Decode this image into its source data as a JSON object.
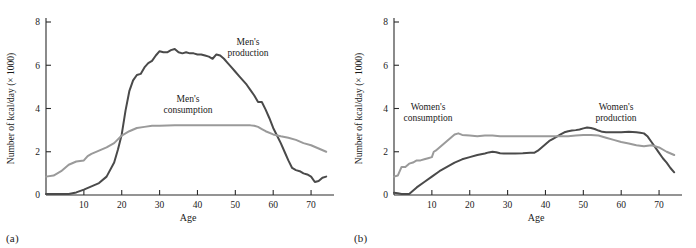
{
  "figure": {
    "panels": [
      {
        "caption": "(a)",
        "id": "panel-a",
        "annotations": [
          {
            "name": "mens-production-label",
            "lines": [
              "Men's",
              "production"
            ],
            "x": 248,
            "y": 45
          },
          {
            "name": "mens-consumption-label",
            "lines": [
              "Men's",
              "consumption"
            ],
            "x": 188,
            "y": 102
          }
        ]
      },
      {
        "caption": "(b)",
        "id": "panel-b",
        "annotations": [
          {
            "name": "womens-consumption-label",
            "lines": [
              "Women's",
              "consumption"
            ],
            "x": 80,
            "y": 110
          },
          {
            "name": "womens-production-label",
            "lines": [
              "Women's",
              "production"
            ],
            "x": 268,
            "y": 110
          }
        ]
      }
    ]
  },
  "chart_data": [
    {
      "type": "line",
      "panel": "(a)",
      "title": "",
      "xlabel": "Age",
      "ylabel": "Number of kcal/day (× 1000)",
      "xlim": [
        0,
        75
      ],
      "ylim": [
        0,
        8
      ],
      "xticks": [
        10,
        20,
        30,
        40,
        50,
        60,
        70
      ],
      "yticks": [
        0,
        2,
        4,
        6,
        8
      ],
      "grid": false,
      "legend": "annotations",
      "series": [
        {
          "name": "Men's production",
          "color": "#4a4a4a",
          "x": [
            0,
            2,
            4,
            6,
            8,
            10,
            12,
            14,
            16,
            18,
            19,
            20,
            21,
            22,
            23,
            24,
            25,
            26,
            27,
            28,
            29,
            30,
            31,
            32,
            33,
            34,
            35,
            36,
            37,
            38,
            39,
            40,
            41,
            42,
            43,
            44,
            45,
            46,
            47,
            48,
            49,
            50,
            51,
            52,
            53,
            54,
            55,
            56,
            57,
            58,
            59,
            60,
            61,
            62,
            63,
            64,
            65,
            66,
            67,
            68,
            69,
            70,
            71,
            72,
            73,
            74
          ],
          "y": [
            0.05,
            0.05,
            0.05,
            0.05,
            0.12,
            0.25,
            0.4,
            0.55,
            0.85,
            1.5,
            2.1,
            2.8,
            3.9,
            4.8,
            5.3,
            5.55,
            5.6,
            5.9,
            6.1,
            6.2,
            6.45,
            6.65,
            6.6,
            6.6,
            6.7,
            6.75,
            6.6,
            6.55,
            6.6,
            6.55,
            6.55,
            6.5,
            6.5,
            6.45,
            6.4,
            6.3,
            6.5,
            6.45,
            6.3,
            6.1,
            5.9,
            5.7,
            5.5,
            5.3,
            5.1,
            4.85,
            4.6,
            4.3,
            4.3,
            3.95,
            3.55,
            3.1,
            2.75,
            2.4,
            2.0,
            1.6,
            1.25,
            1.15,
            1.1,
            1.0,
            0.95,
            0.85,
            0.6,
            0.65,
            0.8,
            0.85
          ]
        },
        {
          "name": "Men's consumption",
          "color": "#9a9a9a",
          "x": [
            0,
            2,
            4,
            6,
            8,
            10,
            11,
            12,
            14,
            16,
            18,
            20,
            22,
            24,
            26,
            28,
            30,
            34,
            38,
            42,
            46,
            50,
            52,
            54,
            55,
            56,
            57,
            58,
            60,
            62,
            64,
            66,
            68,
            70,
            72,
            74
          ],
          "y": [
            0.85,
            0.9,
            1.1,
            1.4,
            1.55,
            1.6,
            1.8,
            1.9,
            2.05,
            2.2,
            2.4,
            2.75,
            2.95,
            3.1,
            3.15,
            3.2,
            3.2,
            3.22,
            3.22,
            3.22,
            3.22,
            3.22,
            3.22,
            3.22,
            3.2,
            3.15,
            3.05,
            2.95,
            2.8,
            2.72,
            2.65,
            2.55,
            2.4,
            2.3,
            2.15,
            2.0
          ]
        }
      ]
    },
    {
      "type": "line",
      "panel": "(b)",
      "title": "",
      "xlabel": "Age",
      "ylabel": "Number of kcal/day (× 1000)",
      "xlim": [
        0,
        75
      ],
      "ylim": [
        0,
        8
      ],
      "xticks": [
        10,
        20,
        30,
        40,
        50,
        60,
        70
      ],
      "yticks": [
        0,
        2,
        4,
        6,
        8
      ],
      "grid": false,
      "legend": "annotations",
      "series": [
        {
          "name": "Women's production",
          "color": "#4a4a4a",
          "x": [
            0,
            1,
            2,
            3,
            4,
            5,
            6,
            8,
            10,
            12,
            14,
            16,
            18,
            20,
            22,
            24,
            25,
            26,
            27,
            28,
            29,
            30,
            32,
            34,
            36,
            37,
            38,
            39,
            40,
            41,
            42,
            43,
            44,
            45,
            46,
            47,
            48,
            49,
            50,
            51,
            52,
            53,
            54,
            55,
            56,
            58,
            60,
            62,
            64,
            65,
            66,
            67,
            68,
            69,
            70,
            71,
            72,
            73,
            74
          ],
          "y": [
            0.1,
            0.08,
            0.05,
            0.05,
            0.05,
            0.2,
            0.35,
            0.6,
            0.85,
            1.1,
            1.3,
            1.5,
            1.65,
            1.75,
            1.85,
            1.92,
            1.97,
            2.0,
            1.98,
            1.93,
            1.92,
            1.92,
            1.92,
            1.93,
            1.95,
            1.95,
            2.05,
            2.2,
            2.35,
            2.5,
            2.6,
            2.7,
            2.8,
            2.9,
            2.95,
            2.98,
            3.0,
            3.03,
            3.08,
            3.12,
            3.1,
            3.05,
            2.98,
            2.92,
            2.9,
            2.9,
            2.9,
            2.92,
            2.9,
            2.88,
            2.85,
            2.7,
            2.45,
            2.2,
            1.95,
            1.7,
            1.5,
            1.25,
            1.05
          ]
        },
        {
          "name": "Women's consumption",
          "color": "#9a9a9a",
          "x": [
            0,
            1,
            2,
            3,
            4,
            5,
            6,
            7,
            8,
            9,
            10,
            10.5,
            11,
            12,
            13,
            14,
            15,
            16,
            17,
            18,
            20,
            22,
            24,
            26,
            28,
            30,
            32,
            34,
            36,
            38,
            40,
            42,
            44,
            46,
            48,
            50,
            52,
            54,
            56,
            58,
            60,
            62,
            64,
            66,
            68,
            70,
            72,
            74
          ],
          "y": [
            0.85,
            0.9,
            1.3,
            1.3,
            1.45,
            1.5,
            1.6,
            1.6,
            1.65,
            1.7,
            1.75,
            2.0,
            2.05,
            2.2,
            2.35,
            2.5,
            2.65,
            2.8,
            2.85,
            2.78,
            2.75,
            2.72,
            2.75,
            2.75,
            2.72,
            2.72,
            2.72,
            2.72,
            2.72,
            2.72,
            2.72,
            2.72,
            2.72,
            2.72,
            2.75,
            2.78,
            2.78,
            2.75,
            2.65,
            2.55,
            2.45,
            2.38,
            2.3,
            2.25,
            2.3,
            2.2,
            2.0,
            1.85
          ]
        }
      ]
    }
  ]
}
